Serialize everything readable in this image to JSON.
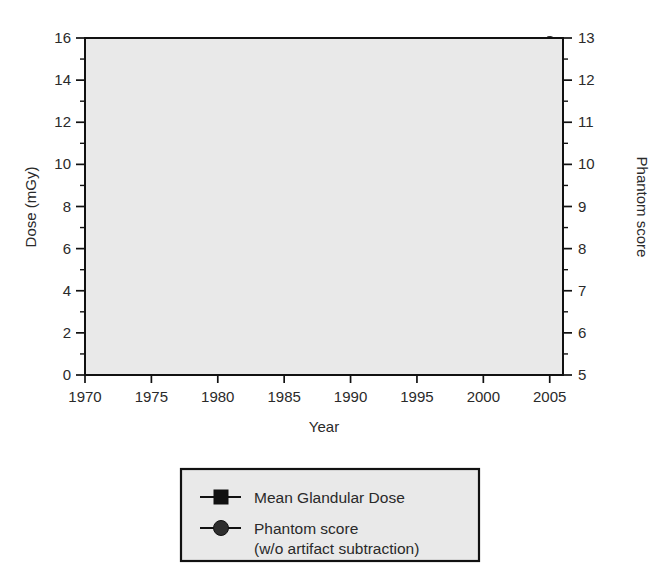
{
  "chart_data": {
    "type": "line",
    "title": "",
    "xlabel": "Year",
    "ylabel": "Dose (mGy)",
    "y2label": "Phantom score",
    "xlim": [
      1970,
      2006
    ],
    "ylim": [
      0,
      16
    ],
    "y2lim": [
      5,
      13
    ],
    "xticks": [
      1970,
      1975,
      1980,
      1985,
      1990,
      1995,
      2000,
      2005
    ],
    "xtick_labels": [
      "1970",
      "1975",
      "1980",
      "1985",
      "1990",
      "1995",
      "2000",
      "2005"
    ],
    "yticks": [
      0,
      2,
      4,
      6,
      8,
      10,
      12,
      14,
      16
    ],
    "ytick_labels": [
      "0",
      "2",
      "4",
      "6",
      "8",
      "10",
      "12",
      "14",
      "16"
    ],
    "yminor": [
      1,
      3,
      5,
      7,
      9,
      11,
      13,
      15
    ],
    "y2ticks": [
      5,
      6,
      7,
      8,
      9,
      10,
      11,
      12,
      13
    ],
    "y2tick_labels": [
      "5",
      "6",
      "7",
      "8",
      "9",
      "10",
      "11",
      "12",
      "13"
    ],
    "y2minor": [
      5.5,
      6.5,
      7.5,
      8.5,
      9.5,
      10.5,
      11.5,
      12.5
    ],
    "grid": "horizontal-dashed",
    "gridvalues": [
      2,
      4,
      6,
      8,
      10,
      12,
      14
    ],
    "plot_bg": "#e9e9e9",
    "legend_position": "below-plot",
    "series": [
      {
        "name": "Mean Glandular Dose",
        "axis": "left",
        "marker": "square",
        "color": "#111111",
        "x": [
          1974,
          1976,
          1980,
          1985,
          1988,
          1992,
          1995,
          1996,
          1997,
          1998,
          1999,
          2000,
          2001,
          2002,
          2003,
          2004,
          2005
        ],
        "values": [
          13.8,
          4.15,
          2.5,
          2.2,
          1.8,
          1.5,
          1.48,
          1.6,
          1.6,
          1.62,
          1.65,
          1.65,
          1.68,
          1.7,
          1.72,
          1.75,
          1.75
        ]
      },
      {
        "name": "Phantom score (w/o artifact subtraction)",
        "axis": "right",
        "marker": "circle",
        "color": "#2e2e2e",
        "x": [
          1985,
          1988,
          1992,
          1995,
          1996,
          1997,
          1998,
          1999,
          2000,
          2001,
          2002,
          2003,
          2004,
          2005
        ],
        "values": [
          7.8,
          10.3,
          11.1,
          11.9,
          12.0,
          12.15,
          12.3,
          12.42,
          12.52,
          12.62,
          12.72,
          12.78,
          12.85,
          12.88
        ]
      }
    ]
  },
  "legend": {
    "entries": [
      {
        "label": "Mean Glandular Dose",
        "sublabel": "",
        "marker": "square"
      },
      {
        "label": "Phantom score",
        "sublabel": "(w/o artifact subtraction)",
        "marker": "circle"
      }
    ]
  }
}
